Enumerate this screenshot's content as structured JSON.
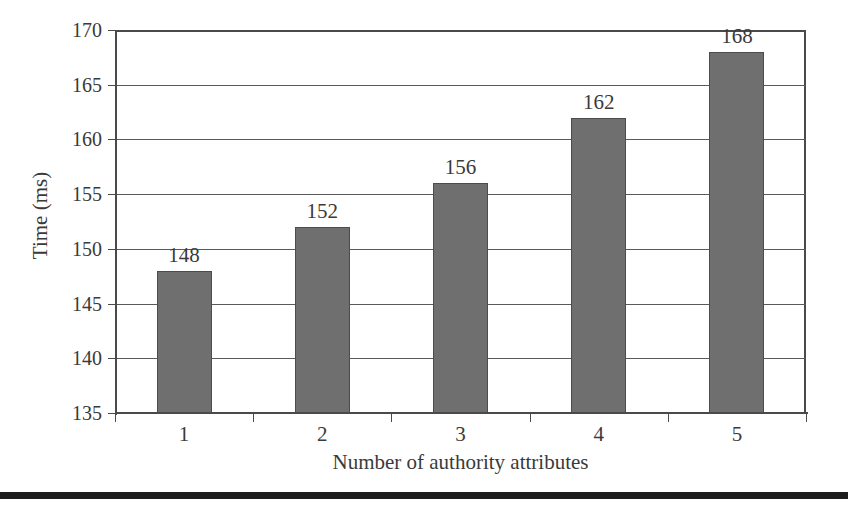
{
  "chart_data": {
    "type": "bar",
    "title": "",
    "categories": [
      "1",
      "2",
      "3",
      "4",
      "5"
    ],
    "values": [
      148,
      152,
      156,
      162,
      168
    ],
    "data_labels": [
      "148",
      "152",
      "156",
      "162",
      "168"
    ],
    "xlabel": "Number of authority attributes",
    "ylabel": "Time (ms)",
    "ylim": [
      135,
      170
    ],
    "ytick_values": [
      135,
      140,
      145,
      150,
      155,
      160,
      165,
      170
    ],
    "ytick_labels": [
      "135",
      "140",
      "145",
      "150",
      "155",
      "160",
      "165",
      "170"
    ],
    "ytick_step": 5,
    "grid": true,
    "grid_orientation": "horizontal",
    "legend": null,
    "series_name": "Time",
    "units": "ms",
    "bar_color": "#6f6f6f",
    "bar_border_color": "#4c4c4c",
    "axis_color": "#4a4a4a",
    "grid_color": "#5a5a5a",
    "text_color": "#3a3a3a",
    "background_color": "#ffffff"
  },
  "figure": {
    "footer_rule_color": "#1c1c1c"
  }
}
